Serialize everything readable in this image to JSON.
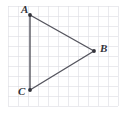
{
  "figure": {
    "kind": "coordinate-grid-triangle",
    "width": 126,
    "height": 115,
    "background_color": "#ffffff",
    "grid": {
      "origin_x": 8,
      "origin_y": 6,
      "cell_size": 10,
      "columns": 11,
      "rows": 10,
      "line_color": "#dcdce2",
      "line_width": 0.6,
      "visible": true
    },
    "shape": {
      "name": "triangle-ABC",
      "stroke_color": "#55555e",
      "stroke_width": 1.4,
      "fill": "none"
    },
    "vertices": [
      {
        "id": "A",
        "label": "A",
        "x": 30,
        "y": 15,
        "label_x": 21,
        "label_y": 4,
        "grid_x": 2,
        "grid_y": 1
      },
      {
        "id": "B",
        "label": "B",
        "x": 94,
        "y": 51,
        "label_x": 100,
        "label_y": 43,
        "grid_x": 9,
        "grid_y": 5
      },
      {
        "id": "C",
        "label": "C",
        "x": 30,
        "y": 90,
        "label_x": 18,
        "label_y": 86,
        "grid_x": 2,
        "grid_y": 8
      }
    ],
    "vertex_marker": {
      "radius": 1.9,
      "color": "#33333a"
    },
    "edges": [
      {
        "id": "AB",
        "from": "A",
        "to": "B"
      },
      {
        "id": "BC",
        "from": "B",
        "to": "C"
      },
      {
        "id": "CA",
        "from": "C",
        "to": "A"
      }
    ]
  }
}
